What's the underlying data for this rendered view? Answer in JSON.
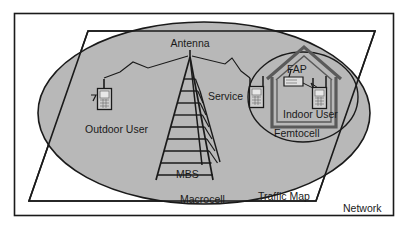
{
  "figure": {
    "title": "",
    "type": "network-architecture-diagram",
    "background_color": "#ffffff",
    "macrocell_fill": "#b8b8b8",
    "stroke_color": "#1a1a1a",
    "house_stroke_color": "#555555"
  },
  "labels": {
    "antenna": "Antenna",
    "outdoor_user": "Outdoor User",
    "service": "Service",
    "fap": "FAP",
    "indoor_user": "Indoor User",
    "femtocell": "Femtocell",
    "mbs": "MBS",
    "macrocell": "Macrocell",
    "traffic_map": "Traffic Map",
    "network": "Network"
  },
  "elements": {
    "outer_border": "network-boundary-rectangle",
    "parallelogram": "traffic-map-plane",
    "ellipse": "macrocell-coverage-area",
    "circle": "femtocell-coverage-area",
    "tower": "mbs-antenna-tower",
    "house": "indoor-house-outline",
    "phones": [
      "outdoor-user-phone",
      "service-edge-phone",
      "indoor-user-phone"
    ],
    "fap_device": "femtocell-access-point",
    "signal_links": [
      "tower-to-outdoor-user",
      "tower-to-service-phone",
      "fap-to-indoor-user"
    ]
  }
}
